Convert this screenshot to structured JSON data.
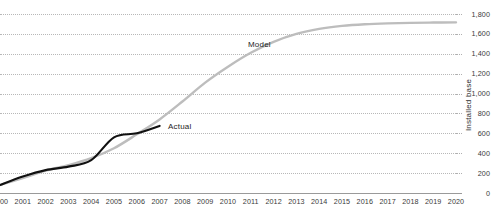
{
  "chart_data": {
    "type": "line",
    "title": "",
    "subtitle": "",
    "xlabel": "",
    "ylabel": "Installed base",
    "grid": true,
    "grid_style": "dotted-horizontal",
    "legend": "inline-annotations",
    "xlim": [
      2000,
      2020
    ],
    "ylim": [
      0,
      1800
    ],
    "ytick_step": 200,
    "categories": [
      "2000",
      "2001",
      "2002",
      "2003",
      "2004",
      "2005",
      "2006",
      "2007",
      "2008",
      "2009",
      "2010",
      "2011",
      "2012",
      "2013",
      "2014",
      "2015",
      "2016",
      "2017",
      "2018",
      "2019",
      "2020"
    ],
    "ytick_labels": [
      "0",
      "200",
      "400",
      "600",
      "800",
      "1,000",
      "1,200",
      "1,400",
      "1,600",
      "1,800"
    ],
    "ytick_values": [
      0,
      200,
      400,
      600,
      800,
      1000,
      1200,
      1400,
      1600,
      1800
    ],
    "series": [
      {
        "name": "Actual",
        "color": "#111111",
        "x": [
          2000,
          2001,
          2002,
          2003,
          2004,
          2005,
          2006,
          2007
        ],
        "values": [
          80,
          165,
          230,
          265,
          330,
          560,
          600,
          675
        ]
      },
      {
        "name": "Model",
        "color": "#bdbdbd",
        "x": [
          2000,
          2001,
          2002,
          2003,
          2004,
          2005,
          2006,
          2007,
          2008,
          2009,
          2010,
          2011,
          2012,
          2013,
          2014,
          2015,
          2016,
          2017,
          2018,
          2019,
          2020
        ],
        "values": [
          80,
          150,
          225,
          280,
          350,
          450,
          590,
          740,
          920,
          1110,
          1270,
          1410,
          1520,
          1600,
          1650,
          1680,
          1697,
          1706,
          1711,
          1714,
          1716
        ]
      }
    ],
    "annotations": [
      {
        "label": "Model",
        "x_px": 248,
        "y_px": 40
      },
      {
        "label": "Actual",
        "x_px": 168,
        "y_px": 122
      }
    ]
  }
}
